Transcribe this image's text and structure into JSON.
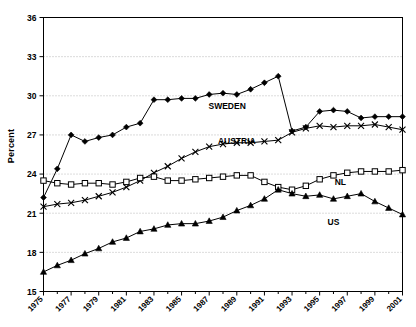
{
  "chart_data": {
    "type": "line",
    "title": "",
    "xlabel": "",
    "ylabel": "Percent",
    "xlim": [
      1975,
      2001
    ],
    "ylim": [
      15,
      36
    ],
    "yticks": [
      15,
      18,
      21,
      24,
      27,
      30,
      33,
      36
    ],
    "ytick_labels": [
      "15",
      "18",
      "21",
      "24",
      "27",
      "30",
      "33",
      "36"
    ],
    "x": [
      1975,
      1976,
      1977,
      1978,
      1979,
      1980,
      1981,
      1982,
      1983,
      1984,
      1985,
      1986,
      1987,
      1988,
      1989,
      1990,
      1991,
      1992,
      1993,
      1994,
      1995,
      1996,
      1997,
      1998,
      1999,
      2000,
      2001
    ],
    "xtick_labels": [
      "1975",
      "1977",
      "1979",
      "1981",
      "1983",
      "1985",
      "1987",
      "1989",
      "1991",
      "1993",
      "1995",
      "1997",
      "1999",
      "2001"
    ],
    "xtick_values": [
      1975,
      1977,
      1979,
      1981,
      1983,
      1985,
      1987,
      1989,
      1991,
      1993,
      1995,
      1997,
      1999,
      2001
    ],
    "grid": true,
    "grid_axis": "y",
    "grid_style": "dotted",
    "legend": "inline-annotations",
    "series": [
      {
        "name": "SWEDEN",
        "marker": "filled-diamond",
        "color": "#000000",
        "label_x": 1988.3,
        "label_y": 29.0,
        "values": [
          22.2,
          24.4,
          27.0,
          26.5,
          26.8,
          27.0,
          27.6,
          27.9,
          29.7,
          29.7,
          29.8,
          29.8,
          30.1,
          30.2,
          30.1,
          30.5,
          31.0,
          31.5,
          27.3,
          27.6,
          28.8,
          28.9,
          28.8,
          28.3,
          28.4,
          28.4,
          28.4
        ]
      },
      {
        "name": "AUSTRIA",
        "marker": "cross-x",
        "color": "#000000",
        "label_x": 1989.0,
        "label_y": 26.3,
        "values": [
          21.5,
          21.7,
          21.8,
          22.0,
          22.3,
          22.6,
          23.0,
          23.5,
          24.1,
          24.6,
          25.2,
          25.7,
          26.1,
          26.3,
          26.4,
          26.4,
          26.5,
          26.6,
          27.2,
          27.5,
          27.7,
          27.6,
          27.7,
          27.7,
          27.8,
          27.6,
          27.4
        ]
      },
      {
        "name": "NL",
        "marker": "open-square",
        "color": "#000000",
        "label_x": 1996.5,
        "label_y": 23.2,
        "values": [
          23.5,
          23.3,
          23.2,
          23.3,
          23.3,
          23.2,
          23.4,
          23.7,
          23.8,
          23.5,
          23.5,
          23.6,
          23.7,
          23.8,
          23.9,
          23.9,
          23.4,
          23.0,
          22.8,
          23.1,
          23.6,
          23.9,
          24.1,
          24.2,
          24.2,
          24.2,
          24.3
        ]
      },
      {
        "name": "US",
        "marker": "filled-triangle",
        "color": "#000000",
        "label_x": 1996.0,
        "label_y": 20.1,
        "values": [
          16.5,
          17.0,
          17.4,
          17.9,
          18.3,
          18.8,
          19.1,
          19.6,
          19.8,
          20.1,
          20.2,
          20.2,
          20.4,
          20.7,
          21.2,
          21.6,
          22.1,
          22.8,
          22.5,
          22.3,
          22.4,
          22.1,
          22.3,
          22.5,
          21.9,
          21.4,
          20.9
        ]
      }
    ]
  }
}
